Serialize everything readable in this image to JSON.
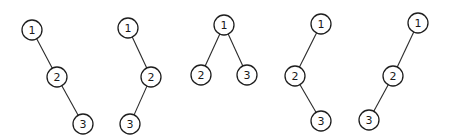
{
  "diagram": {
    "node_radius": 10,
    "colors": {
      "stroke": "#1e1e1e",
      "fill": "#ffffff",
      "text": "#1a1a1a"
    },
    "trees": [
      {
        "id": "tree-1",
        "nodes": [
          {
            "label": "1",
            "x": 32,
            "y": 30
          },
          {
            "label": "2",
            "x": 57,
            "y": 77
          },
          {
            "label": "3",
            "x": 83,
            "y": 124
          }
        ],
        "edges": [
          [
            0,
            1
          ],
          [
            1,
            2
          ]
        ]
      },
      {
        "id": "tree-2",
        "nodes": [
          {
            "label": "1",
            "x": 128,
            "y": 28
          },
          {
            "label": "2",
            "x": 151,
            "y": 77
          },
          {
            "label": "3",
            "x": 130,
            "y": 124
          }
        ],
        "edges": [
          [
            0,
            1
          ],
          [
            1,
            2
          ]
        ]
      },
      {
        "id": "tree-3",
        "nodes": [
          {
            "label": "1",
            "x": 224,
            "y": 25
          },
          {
            "label": "2",
            "x": 201,
            "y": 75
          },
          {
            "label": "3",
            "x": 247,
            "y": 75
          }
        ],
        "edges": [
          [
            0,
            1
          ],
          [
            0,
            2
          ]
        ]
      },
      {
        "id": "tree-4",
        "nodes": [
          {
            "label": "1",
            "x": 321,
            "y": 24
          },
          {
            "label": "2",
            "x": 295,
            "y": 76
          },
          {
            "label": "3",
            "x": 321,
            "y": 121
          }
        ],
        "edges": [
          [
            0,
            1
          ],
          [
            1,
            2
          ]
        ]
      },
      {
        "id": "tree-5",
        "nodes": [
          {
            "label": "1",
            "x": 418,
            "y": 23
          },
          {
            "label": "2",
            "x": 393,
            "y": 76
          },
          {
            "label": "3",
            "x": 369,
            "y": 120
          }
        ],
        "edges": [
          [
            0,
            1
          ],
          [
            1,
            2
          ]
        ]
      }
    ]
  }
}
